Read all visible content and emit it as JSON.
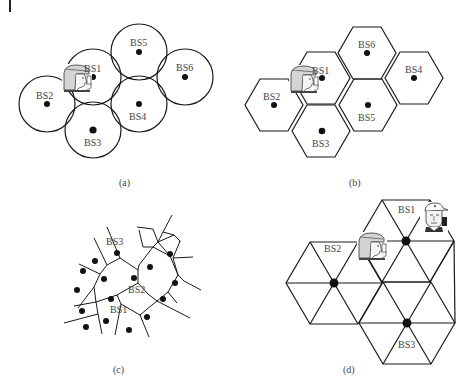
{
  "figure": {
    "panels": [
      {
        "id": "a",
        "caption": "(a)",
        "model": "circular coverage cells",
        "stations": [
          {
            "label": "BS1",
            "x": 93,
            "y": 77
          },
          {
            "label": "BS2",
            "x": 47,
            "y": 104
          },
          {
            "label": "BS3",
            "x": 93,
            "y": 130
          },
          {
            "label": "BS4",
            "x": 139,
            "y": 104
          },
          {
            "label": "BS5",
            "x": 139,
            "y": 52
          },
          {
            "label": "BS6",
            "x": 185,
            "y": 77
          }
        ],
        "user": {
          "type": "user-with-phone",
          "near": "BS1"
        }
      },
      {
        "id": "b",
        "caption": "(b)",
        "model": "hexagonal cells",
        "stations": [
          {
            "label": "BS1",
            "x": 321,
            "y": 78
          },
          {
            "label": "BS2",
            "x": 274,
            "y": 105
          },
          {
            "label": "BS3",
            "x": 321,
            "y": 131
          },
          {
            "label": "BS4",
            "x": 414,
            "y": 78
          },
          {
            "label": "BS5",
            "x": 368,
            "y": 105
          },
          {
            "label": "BS6",
            "x": 367,
            "y": 53
          }
        ],
        "user": {
          "type": "user-with-phone",
          "near": "BS1"
        }
      },
      {
        "id": "c",
        "caption": "(c)",
        "model": "Voronoi tessellation",
        "labels": [
          "BS3",
          "BS2",
          "BS1"
        ]
      },
      {
        "id": "d",
        "caption": "(d)",
        "model": "triangular sectors",
        "stations": [
          {
            "label": "BS1",
            "x": 406,
            "y": 241
          },
          {
            "label": "BS2",
            "x": 334,
            "y": 283
          },
          {
            "label": "BS3",
            "x": 407,
            "y": 323
          }
        ],
        "users": [
          {
            "type": "user-with-phone",
            "position": "between BS2 and BS1"
          },
          {
            "type": "user-with-cap-and-phone",
            "position": "right of BS1"
          }
        ]
      }
    ],
    "labels": {
      "a_bs1": "BS1",
      "a_bs2": "BS2",
      "a_bs3": "BS3",
      "a_bs4": "BS4",
      "a_bs5": "BS5",
      "a_bs6": "BS6",
      "b_bs1": "BS1",
      "b_bs2": "BS2",
      "b_bs3": "BS3",
      "b_bs4": "BS4",
      "b_bs5": "BS5",
      "b_bs6": "BS6",
      "c_bs1": "BS1",
      "c_bs2": "BS2",
      "c_bs3": "BS3",
      "d_bs1": "BS1",
      "d_bs2": "BS2",
      "d_bs3": "BS3",
      "cap_a": "(a)",
      "cap_b": "(b)",
      "cap_c": "(c)",
      "cap_d": "(d)"
    },
    "colors": {
      "line": "#1a1a1a",
      "text": "#444444",
      "dot": "#111111",
      "user_fill": "#d4d4d4"
    }
  }
}
